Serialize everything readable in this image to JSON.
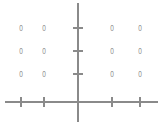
{
  "figure": {
    "title": "",
    "background_color": "#ffffff",
    "line_color": "#8a8a8a",
    "label_color": "#8f8f8f",
    "width": 164,
    "height": 127
  },
  "axes": {
    "x_axis": {
      "name": "x-axis",
      "y_position": 102,
      "x_start": 5,
      "x_end": 158,
      "tick_positions": [
        21,
        44,
        112,
        140
      ],
      "tick_half_length": 5,
      "origin_tick": false
    },
    "y_axis": {
      "name": "y-axis",
      "x_position": 78,
      "y_start": 3,
      "y_end": 122,
      "tick_positions": [
        28,
        51,
        74
      ],
      "tick_half_length": 5,
      "origin_tick": false
    },
    "origin": {
      "x": 78,
      "y": 102
    }
  },
  "chart_data": {
    "type": "scatter",
    "title": "",
    "xlabel": "",
    "ylabel": "",
    "grid": false,
    "legend": null,
    "axis_ticks_unlabeled": true,
    "marker_text": "0",
    "columns_px": [
      21,
      44,
      112,
      140
    ],
    "rows_px": [
      28,
      51,
      74
    ],
    "xlim": [
      5,
      158
    ],
    "ylim": [
      122,
      3
    ],
    "x": [
      21,
      44,
      112,
      140,
      21,
      44,
      112,
      140,
      21,
      44,
      112,
      140
    ],
    "y": [
      28,
      28,
      28,
      28,
      51,
      51,
      51,
      51,
      74,
      74,
      74,
      74
    ],
    "points": [
      {
        "x": 21,
        "y": 28,
        "label": "0"
      },
      {
        "x": 44,
        "y": 28,
        "label": "0"
      },
      {
        "x": 112,
        "y": 28,
        "label": "0"
      },
      {
        "x": 140,
        "y": 28,
        "label": "0"
      },
      {
        "x": 21,
        "y": 51,
        "label": "0"
      },
      {
        "x": 44,
        "y": 51,
        "label": "0"
      },
      {
        "x": 112,
        "y": 51,
        "label": "0"
      },
      {
        "x": 140,
        "y": 51,
        "label": "0"
      },
      {
        "x": 21,
        "y": 74,
        "label": "0"
      },
      {
        "x": 44,
        "y": 74,
        "label": "0"
      },
      {
        "x": 112,
        "y": 74,
        "label": "0"
      },
      {
        "x": 140,
        "y": 74,
        "label": "0"
      }
    ]
  }
}
